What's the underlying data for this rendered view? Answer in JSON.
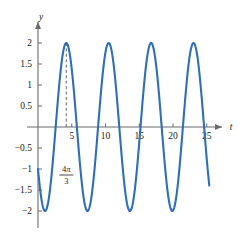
{
  "chart_data": {
    "type": "line",
    "title": "",
    "subtitle": "",
    "xlabel": "t",
    "ylabel": "y",
    "grid": false,
    "legend": null,
    "xlim": [
      -0.6,
      26.5
    ],
    "ylim": [
      -2.35,
      2.3
    ],
    "xticks": [
      5,
      10,
      15,
      20,
      25
    ],
    "xtick_labels": [
      "5",
      "10",
      "15",
      "20",
      "25"
    ],
    "yticks": [
      2,
      1.5,
      1,
      0.5,
      -0.5,
      -1,
      -1.5,
      -2
    ],
    "ytick_labels": [
      "2",
      "1.5",
      "1",
      "0.5",
      "−0.5",
      "−1",
      "−1.5",
      "−2"
    ],
    "series": [
      {
        "name": "y = 2 sin(t − 4π/3 + π/2)",
        "color": "#2E6FB7",
        "amplitude": 2,
        "period": 6.283185307,
        "peak_t": 4.18879,
        "x_start": 0,
        "x_end": 25.4,
        "points": [
          [
            0.0,
            -1.0
          ],
          [
            0.5,
            -1.72
          ],
          [
            1.0,
            -1.99
          ],
          [
            1.5,
            -1.77
          ],
          [
            2.0,
            -1.11
          ],
          [
            2.5,
            -0.17
          ],
          [
            3.0,
            0.82
          ],
          [
            3.5,
            1.59
          ],
          [
            4.0,
            1.97
          ],
          [
            4.19,
            2.0
          ],
          [
            4.5,
            1.89
          ],
          [
            5.0,
            1.41
          ],
          [
            5.5,
            0.59
          ],
          [
            6.0,
            -0.4
          ],
          [
            6.5,
            -1.3
          ],
          [
            7.0,
            -1.85
          ],
          [
            7.47,
            -2.0
          ],
          [
            8.0,
            -1.82
          ],
          [
            8.5,
            -1.24
          ],
          [
            9.0,
            -0.33
          ],
          [
            9.5,
            0.65
          ],
          [
            10.0,
            1.48
          ],
          [
            10.47,
            2.0
          ],
          [
            11.0,
            1.87
          ],
          [
            11.5,
            1.34
          ],
          [
            12.0,
            0.5
          ],
          [
            12.5,
            -0.49
          ],
          [
            13.0,
            -1.37
          ],
          [
            13.5,
            -1.88
          ],
          [
            13.75,
            -2.0
          ],
          [
            14.5,
            -1.71
          ],
          [
            15.0,
            -1.09
          ],
          [
            15.5,
            -0.15
          ],
          [
            16.0,
            0.84
          ],
          [
            16.5,
            1.6
          ],
          [
            16.76,
            2.0
          ],
          [
            17.5,
            1.77
          ],
          [
            18.0,
            1.11
          ],
          [
            18.5,
            0.17
          ],
          [
            19.0,
            -0.82
          ],
          [
            19.5,
            -1.59
          ],
          [
            20.04,
            -2.0
          ],
          [
            20.5,
            -1.89
          ],
          [
            21.0,
            -1.41
          ],
          [
            21.5,
            -0.59
          ],
          [
            22.0,
            0.4
          ],
          [
            22.5,
            1.3
          ],
          [
            23.0,
            1.85
          ],
          [
            23.04,
            2.0
          ],
          [
            23.5,
            1.82
          ],
          [
            24.0,
            1.24
          ],
          [
            24.5,
            0.33
          ],
          [
            25.0,
            -0.65
          ],
          [
            25.4,
            -0.8
          ]
        ]
      }
    ],
    "annotations": [
      {
        "name": "peak-marker",
        "type": "dashed-vertical",
        "x_value": 4.18879,
        "y_from": 0,
        "y_to": 2,
        "label_numerator": "4π",
        "label_denominator": "3",
        "label_plain": "4π/3",
        "color": "#555555"
      }
    ],
    "axis_color": "#6b6b6b",
    "curve_color": "#2E6FB7",
    "background": "#ffffff"
  },
  "axes": {
    "y_axis_label": "y",
    "x_axis_label": "t"
  },
  "annotation": {
    "numerator_digit": "4",
    "numerator_symbol": "π",
    "denominator": "3"
  }
}
